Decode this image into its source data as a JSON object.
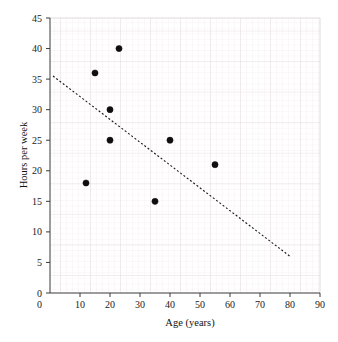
{
  "chart_data": {
    "type": "scatter",
    "title": "",
    "xlabel": "Age (years)",
    "ylabel": "Hours per week",
    "xlim": [
      0,
      90
    ],
    "ylim": [
      0,
      45
    ],
    "xticks": [
      0,
      10,
      20,
      30,
      40,
      50,
      60,
      70,
      80,
      90
    ],
    "yticks": [
      0,
      5,
      10,
      15,
      20,
      25,
      30,
      35,
      40,
      45
    ],
    "xtick_labels": [
      "0",
      "10",
      "20",
      "30",
      "40",
      "50",
      "60",
      "70",
      "80",
      "90"
    ],
    "ytick_labels": [
      "0",
      "5",
      "10",
      "15",
      "20",
      "25",
      "30",
      "35",
      "40",
      "45"
    ],
    "grid": true,
    "grid_minor_step_x": 2,
    "grid_minor_step_y": 1,
    "grid_major_step_x": 10,
    "grid_major_step_y": 5,
    "legend": null,
    "legend_position": "none",
    "marker": "filled-circle",
    "marker_color": "#100f0f",
    "marker_radius_px": 3.1,
    "points": [
      {
        "x": 12,
        "y": 18
      },
      {
        "x": 15,
        "y": 36
      },
      {
        "x": 20,
        "y": 30
      },
      {
        "x": 20,
        "y": 25
      },
      {
        "x": 23,
        "y": 40
      },
      {
        "x": 35,
        "y": 15
      },
      {
        "x": 40,
        "y": 25
      },
      {
        "x": 55,
        "y": 21
      }
    ],
    "trend_line": {
      "style": "dashed",
      "color": "#1b1b1b",
      "x_start": 1,
      "y_start": 35.5,
      "x_end": 80,
      "y_end": 6
    },
    "colors": {
      "background": "#ffffff",
      "grid_minor": "#f2e9ec",
      "grid_major": "#e4dade",
      "axis": "#3a3a3a",
      "text": "#1a1a1a"
    }
  }
}
